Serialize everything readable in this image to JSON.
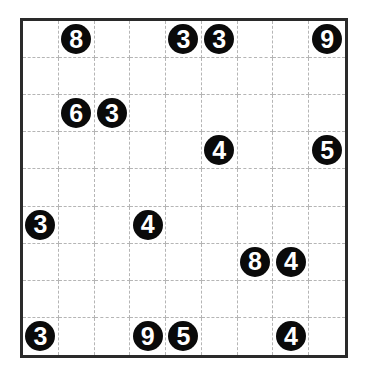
{
  "puzzle": {
    "rows": 9,
    "cols": 9,
    "colors": {
      "border": "#2a2a2a",
      "gridline": "#b5b5b5",
      "clue_fill": "#0a0a0a",
      "clue_text": "#ffffff",
      "background": "#ffffff"
    },
    "clues": [
      {
        "row": 0,
        "col": 1,
        "value": "8"
      },
      {
        "row": 0,
        "col": 4,
        "value": "3"
      },
      {
        "row": 0,
        "col": 5,
        "value": "3"
      },
      {
        "row": 0,
        "col": 8,
        "value": "9"
      },
      {
        "row": 2,
        "col": 1,
        "value": "6"
      },
      {
        "row": 2,
        "col": 2,
        "value": "3"
      },
      {
        "row": 3,
        "col": 5,
        "value": "4"
      },
      {
        "row": 3,
        "col": 8,
        "value": "5"
      },
      {
        "row": 5,
        "col": 0,
        "value": "3"
      },
      {
        "row": 5,
        "col": 3,
        "value": "4"
      },
      {
        "row": 6,
        "col": 6,
        "value": "8"
      },
      {
        "row": 6,
        "col": 7,
        "value": "4"
      },
      {
        "row": 8,
        "col": 0,
        "value": "3"
      },
      {
        "row": 8,
        "col": 3,
        "value": "9"
      },
      {
        "row": 8,
        "col": 4,
        "value": "5"
      },
      {
        "row": 8,
        "col": 7,
        "value": "4"
      }
    ]
  }
}
